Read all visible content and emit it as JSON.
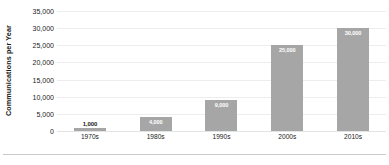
{
  "chart_data": {
    "type": "bar",
    "title": "",
    "xlabel": "",
    "ylabel": "Communications per Year",
    "categories": [
      "1970s",
      "1980s",
      "1990s",
      "2000s",
      "2010s"
    ],
    "values": [
      1000,
      4000,
      9000,
      25000,
      30000
    ],
    "value_labels": [
      "1,000",
      "4,000",
      "9,000",
      "25,000",
      "30,000"
    ],
    "label_placement": [
      "outside",
      "inside",
      "inside",
      "inside",
      "inside"
    ],
    "ylim": [
      0,
      35000
    ],
    "ytick_step": 5000,
    "ytick_labels": [
      "35,000",
      "30,000",
      "25,000",
      "20,000",
      "15,000",
      "10,000",
      "5,000",
      "0"
    ],
    "ytick_values": [
      35000,
      30000,
      25000,
      20000,
      15000,
      10000,
      5000,
      0
    ],
    "grid": true,
    "legend": false,
    "legend_position": "none",
    "colors": {
      "bar_fill": "#a6a6a6",
      "gridline": "#eceded",
      "axis_text": "#222222",
      "label_inside": "#ffffff",
      "label_outside": "#1a1a1a",
      "background": "#ffffff",
      "bottom_rule": "#c9cacb"
    }
  }
}
